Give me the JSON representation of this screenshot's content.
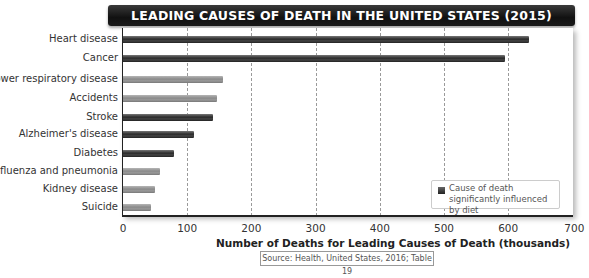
{
  "chart_data": {
    "type": "bar",
    "orientation": "horizontal",
    "title": "LEADING CAUSES OF DEATH IN THE UNITED STATES (2015)",
    "xlabel": "Number of Deaths for Leading Causes of Death (thousands)",
    "ylabel": "",
    "xlim": [
      0,
      700
    ],
    "xticks": [
      0,
      100,
      200,
      300,
      400,
      500,
      600,
      700
    ],
    "grid": "vertical dashed",
    "categories": [
      "Heart disease",
      "Cancer",
      "Lower respiratory disease",
      "Accidents",
      "Stroke",
      "Alzheimer's disease",
      "Diabetes",
      "Influenza and pneumonia",
      "Kidney disease",
      "Suicide"
    ],
    "values": [
      633,
      595,
      155,
      146,
      140,
      110,
      79,
      57,
      50,
      44
    ],
    "diet_influenced": [
      true,
      true,
      false,
      false,
      true,
      true,
      true,
      false,
      false,
      false
    ],
    "legend": {
      "position": "lower right",
      "entries": [
        "Cause of death significantly influenced by diet"
      ]
    },
    "source": "Source: Health, United States, 2016; Table 19",
    "colors": {
      "diet": "#2b2b2b",
      "other": "#8c8c8c"
    }
  },
  "title": "LEADING CAUSES OF DEATH IN THE UNITED STATES (2015)",
  "x_axis": {
    "title": "Number of Deaths for Leading Causes of Death (thousands)",
    "ticks": [
      "0",
      "100",
      "200",
      "300",
      "400",
      "500",
      "600",
      "700"
    ]
  },
  "categories": [
    "Heart disease",
    "Cancer",
    "Lower respiratory disease",
    "Accidents",
    "Stroke",
    "Alzheimer's disease",
    "Diabetes",
    "Influenza and pneumonia",
    "Kidney disease",
    "Suicide"
  ],
  "legend": {
    "label": "Cause of death significantly influenced by diet"
  },
  "source": "Source: Health, United States, 2016; Table 19"
}
